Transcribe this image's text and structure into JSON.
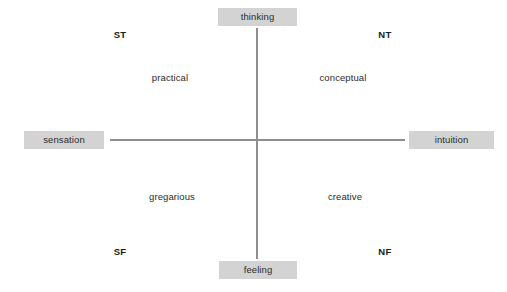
{
  "diagram": {
    "kind": "quadrant-diagram",
    "background_color": "#ffffff",
    "axis_color": "#8e8e8e",
    "label_box_color": "#d3d3d3",
    "text_color": "#2b2b2b",
    "axes": {
      "vertical": {
        "top_pole": "thinking",
        "bottom_pole": "feeling"
      },
      "horizontal": {
        "left_pole": "sensation",
        "right_pole": "intuition"
      }
    },
    "poles": {
      "top": "thinking",
      "bottom": "feeling",
      "left": "sensation",
      "right": "intuition"
    },
    "quadrants": {
      "top_left": {
        "code": "ST",
        "descriptor": "practical"
      },
      "top_right": {
        "code": "NT",
        "descriptor": "conceptual"
      },
      "bottom_left": {
        "code": "SF",
        "descriptor": "gregarious"
      },
      "bottom_right": {
        "code": "NF",
        "descriptor": "creative"
      }
    }
  }
}
